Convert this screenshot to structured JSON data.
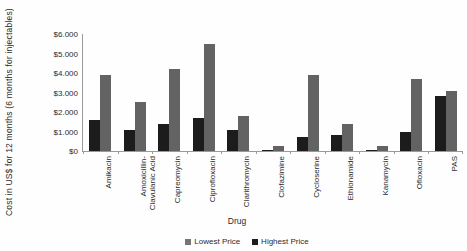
{
  "figure": {
    "y_axis_title": "Cost in US$ for 12 months (6 months for injectables)",
    "x_axis_title": "Drug",
    "y_tick_labels": [
      "$0",
      "$1.000",
      "$2.000",
      "$3.000",
      "$4.000",
      "$5.000",
      "$6.000"
    ],
    "legend": [
      {
        "label": "Lowest Price",
        "color": "#757575"
      },
      {
        "label": "Highest Price",
        "color": "#1c1c1c"
      }
    ]
  },
  "chart_data": {
    "type": "bar",
    "title": "",
    "xlabel": "Drug",
    "ylabel": "Cost in US$ for 12 months (6 months for injectables)",
    "ylim": [
      0,
      6000
    ],
    "y_tick_step": 1000,
    "grid": false,
    "legend_position": "bottom-center",
    "categories": [
      "Amikacin",
      "Amoxicillin-\nClavulanic Acid",
      "Capreomycin",
      "Ciprofloxacin",
      "Clarithromycin",
      "Clofazimine",
      "Cycloserine",
      "Ethionamide",
      "Kanamycin",
      "Ofloxacin",
      "PAS"
    ],
    "series": [
      {
        "name": "Highest Price",
        "color": "#1c1c1c",
        "bar_position": "left",
        "values": [
          1600,
          1100,
          1400,
          1700,
          1100,
          50,
          700,
          800,
          30,
          1000,
          2800
        ]
      },
      {
        "name": "Lowest Price",
        "color": "#636363",
        "bar_position": "right",
        "values": [
          3900,
          2500,
          4200,
          5500,
          1800,
          250,
          3900,
          1400,
          250,
          3700,
          3100
        ]
      }
    ]
  }
}
